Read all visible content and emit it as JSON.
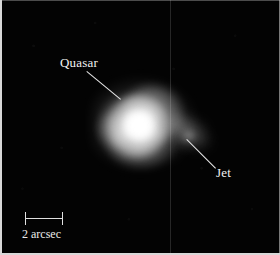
{
  "figure": {
    "kind": "astronomical-image",
    "width": 280,
    "height": 255,
    "background_color": "#030303",
    "frame_color": "#d8d8d8"
  },
  "annotations": [
    {
      "name": "quasar",
      "label": "Quasar",
      "label_x": 60,
      "label_y": 56,
      "leader_from_x": 87,
      "leader_from_y": 71,
      "leader_to_x": 121,
      "leader_to_y": 99,
      "color": "#f2f2f2"
    },
    {
      "name": "jet",
      "label": "Jet",
      "label_x": 216,
      "label_y": 166,
      "leader_from_x": 187,
      "leader_from_y": 139,
      "leader_to_x": 216,
      "leader_to_y": 168,
      "color": "#f2f2f2"
    }
  ],
  "scalebar": {
    "label": "2 arcsec",
    "value": 2,
    "unit": "arcsec",
    "bar_x": 25,
    "bar_y": 218,
    "bar_length_px": 37,
    "color": "#e0e0e0"
  },
  "sources": [
    {
      "name": "quasar-core",
      "center_x": 139,
      "center_y": 126,
      "peak_color": "#ffffff",
      "description": "saturated point-like nucleus"
    },
    {
      "name": "host-halo",
      "center_x": 142,
      "center_y": 124,
      "description": "irregular diffuse nebulosity surrounding the nucleus"
    },
    {
      "name": "jet-plume",
      "center_x": 190,
      "center_y": 138,
      "description": "faint extended emission toward lower right"
    }
  ],
  "artifacts": [
    {
      "name": "chip-gap-seam",
      "x": 170,
      "description": "faint vertical detector seam line"
    }
  ]
}
